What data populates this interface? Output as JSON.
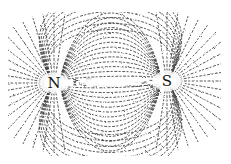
{
  "figure": {
    "ink_color": "#1a1a1a",
    "background_color": "#ffffff",
    "bounds": {
      "x": 8,
      "y": 12,
      "width": 213,
      "height": 144
    }
  },
  "poles": [
    {
      "label": "N",
      "x": 54,
      "y": 83
    },
    {
      "label": "S",
      "x": 167,
      "y": 81
    }
  ]
}
